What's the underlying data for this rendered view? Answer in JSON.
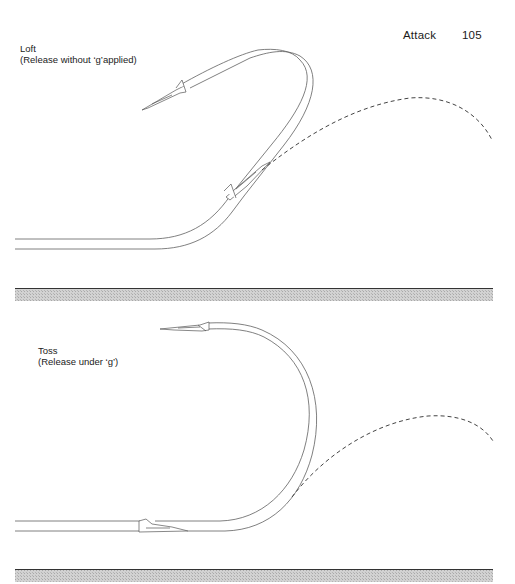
{
  "running_head": {
    "section": "Attack",
    "page_number": "105"
  },
  "panels": [
    {
      "id": "loft",
      "title": "Loft",
      "subtitle": "(Release without ‘g’applied)",
      "elements": [
        "flight-path-double-line",
        "aircraft-at-release",
        "aircraft-at-recovery",
        "dashed-weapon-trajectory",
        "ground-strip"
      ]
    },
    {
      "id": "toss",
      "title": "Toss",
      "subtitle": "(Release under ‘g’)",
      "elements": [
        "flight-path-double-line",
        "aircraft-run-in",
        "aircraft-at-recovery",
        "dashed-weapon-trajectory",
        "ground-strip"
      ]
    }
  ],
  "colors": {
    "line": "#555555",
    "dash": "#444444",
    "ground_top": "#333333",
    "ground_hatch": "#b8b8b8",
    "text": "#1a1a1a"
  }
}
